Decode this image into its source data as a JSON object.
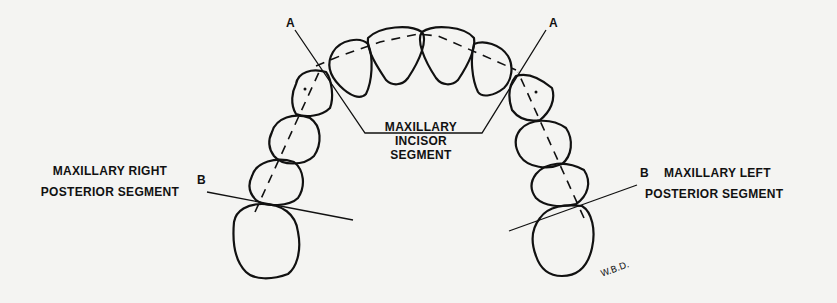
{
  "diagram": {
    "labels": {
      "point_a_left": "A",
      "point_a_right": "A",
      "point_b_left": "B",
      "point_b_right": "B",
      "incisor_segment": [
        "MAXILLARY",
        "INCISOR",
        "SEGMENT"
      ],
      "right_posterior_segment": [
        "MAXILLARY RIGHT",
        "POSTERIOR SEGMENT"
      ],
      "left_posterior_segment": [
        "MAXILLARY LEFT",
        "POSTERIOR SEGMENT"
      ],
      "signature": "W.B.D."
    },
    "colors": {
      "background": "#f4f4f2",
      "ink": "#111111"
    }
  }
}
